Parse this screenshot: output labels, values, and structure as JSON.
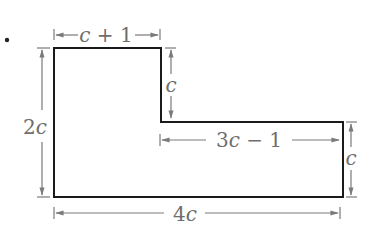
{
  "figure": {
    "bullet": "•",
    "shape": {
      "description": "L-shaped polygon",
      "stroke_color": "#1a1a1a",
      "dimension_color": "#7a7a7a"
    },
    "labels": {
      "top_width": {
        "var": "c",
        "rest": " + 1"
      },
      "left_height": {
        "num": "2",
        "var": "c"
      },
      "notch_height": {
        "var": "c"
      },
      "inner_width": {
        "num": "3",
        "var": "c",
        "rest": " − 1"
      },
      "right_height": {
        "var": "c"
      },
      "bottom_width": {
        "num": "4",
        "var": "c"
      }
    }
  }
}
